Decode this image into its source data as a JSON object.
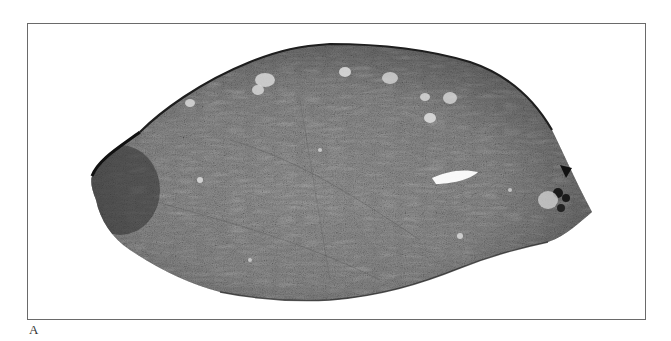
{
  "figure": {
    "panel_label": "A",
    "frame_color": "#6a6a6a",
    "tissue": {
      "fill_base": "#8a8a8a",
      "fill_light": "#c8c8c8",
      "fill_dark": "#3a3a3a",
      "edge_color": "#1e1e1e"
    }
  }
}
